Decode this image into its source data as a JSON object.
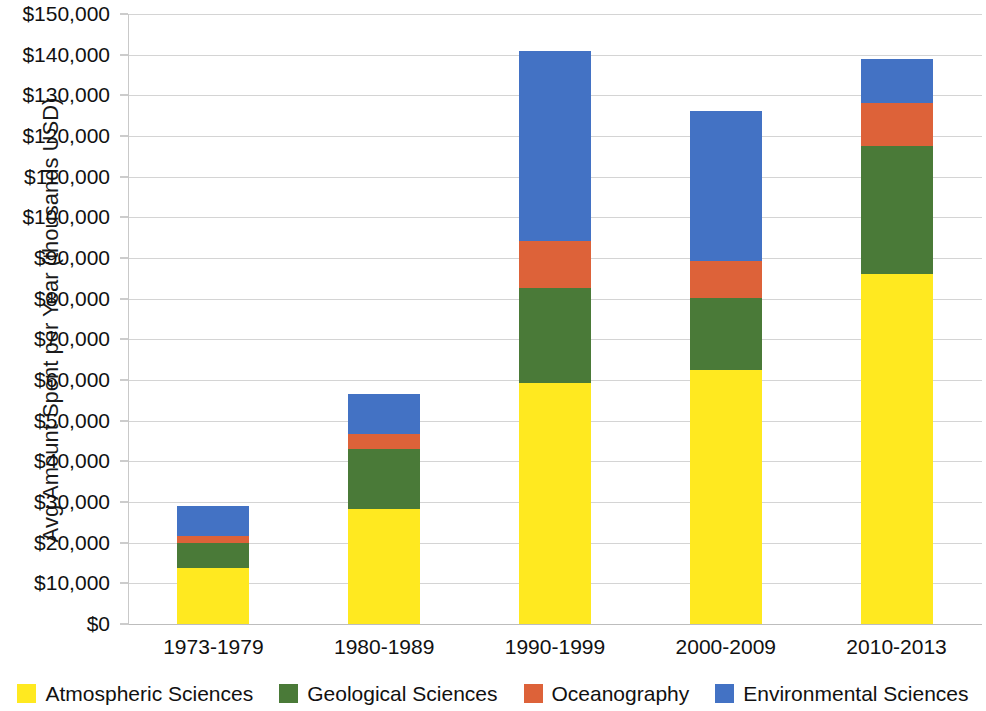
{
  "chart_data": {
    "type": "bar",
    "subtype": "stacked-column",
    "title": "",
    "xlabel": "",
    "ylabel": "Avg Amount Spent per Year (thousands USD)",
    "categories": [
      "1973-1979",
      "1980-1989",
      "1990-1999",
      "2000-2009",
      "2010-2013"
    ],
    "series": [
      {
        "name": "Atmospheric Sciences",
        "color": "#FFE920",
        "values": [
          13800,
          28300,
          59300,
          62500,
          86100
        ]
      },
      {
        "name": "Geological Sciences",
        "color": "#4A7A38",
        "values": [
          6100,
          14800,
          23400,
          17700,
          31500
        ]
      },
      {
        "name": "Oceanography",
        "color": "#DD6239",
        "values": [
          1700,
          3700,
          11600,
          9100,
          10600
        ]
      },
      {
        "name": "Environmental Sciences",
        "color": "#4372C4",
        "values": [
          7400,
          9800,
          46500,
          36900,
          10800
        ]
      }
    ],
    "totals": [
      29000,
      56600,
      140800,
      126200,
      139000
    ],
    "ylim": [
      0,
      150000
    ],
    "ytick_step": 10000,
    "yticks": [
      "$150,000",
      "$140,000",
      "$130,000",
      "$120,000",
      "$110,000",
      "$100,000",
      "$90,000",
      "$80,000",
      "$70,000",
      "$60,000",
      "$50,000",
      "$40,000",
      "$30,000",
      "$20,000",
      "$10,000",
      "$0"
    ],
    "ytick_values": [
      150000,
      140000,
      130000,
      120000,
      110000,
      100000,
      90000,
      80000,
      70000,
      60000,
      50000,
      40000,
      30000,
      20000,
      10000,
      0
    ],
    "grid": true,
    "legend_position": "bottom",
    "legend": [
      {
        "label": "Atmospheric Sciences",
        "color": "#FFE920"
      },
      {
        "label": "Geological Sciences",
        "color": "#4A7A38"
      },
      {
        "label": "Oceanography",
        "color": "#DD6239"
      },
      {
        "label": "Environmental Sciences",
        "color": "#4372C4"
      }
    ]
  }
}
